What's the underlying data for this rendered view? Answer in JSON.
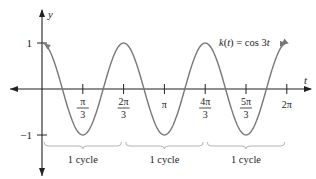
{
  "chart_data": {
    "type": "line",
    "title": "",
    "function_label": "k(t) = cos 3t",
    "function_label_parts": {
      "name": "k",
      "var": "t",
      "rhs": " = cos 3",
      "rhs_var": "t"
    },
    "xlabel": "t",
    "ylabel": "y",
    "xlim": [
      -0.7,
      6.6
    ],
    "ylim": [
      -1.4,
      1.3
    ],
    "x_ticks": [
      {
        "value": 1.0472,
        "num": "π",
        "den": "3"
      },
      {
        "value": 2.0944,
        "num": "2π",
        "den": "3"
      },
      {
        "value": 3.1416,
        "num": "π",
        "den": ""
      },
      {
        "value": 4.1888,
        "num": "4π",
        "den": "3"
      },
      {
        "value": 5.236,
        "num": "5π",
        "den": "3"
      },
      {
        "value": 6.2832,
        "num": "2π",
        "den": ""
      }
    ],
    "y_ticks": [
      {
        "value": 1,
        "label": "1"
      },
      {
        "value": -1,
        "label": "−1"
      }
    ],
    "series": [
      {
        "name": "k(t) = cos 3t",
        "expression": "cos(3t)",
        "t_range": [
          0,
          6.2832
        ],
        "color": "#777777"
      }
    ],
    "annotations": [
      {
        "type": "bracket",
        "from": 0,
        "to": 2.0944,
        "label": "1 cycle"
      },
      {
        "type": "bracket",
        "from": 2.0944,
        "to": 4.1888,
        "label": "1 cycle"
      },
      {
        "type": "bracket",
        "from": 4.1888,
        "to": 6.2832,
        "label": "1 cycle"
      }
    ],
    "grid": false,
    "legend": "none"
  },
  "colors": {
    "axis": "#222222",
    "curve": "#777777",
    "bracket": "#aaaaaa"
  }
}
